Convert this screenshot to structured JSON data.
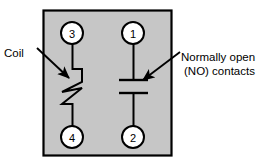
{
  "diagram": {
    "body_panel": {
      "name": "relay-body",
      "fill_color": "#c6c6c6",
      "border_color": "#000000"
    },
    "terminals": [
      {
        "id": "terminal-3",
        "label": "3",
        "cx": 72,
        "cy": 33,
        "r": 11
      },
      {
        "id": "terminal-1",
        "label": "1",
        "cx": 133,
        "cy": 33,
        "r": 11
      },
      {
        "id": "terminal-4",
        "label": "4",
        "cx": 72,
        "cy": 137,
        "r": 11
      },
      {
        "id": "terminal-2",
        "label": "2",
        "cx": 133,
        "cy": 137,
        "r": 11
      }
    ],
    "annotations": [
      {
        "id": "coil-annotation",
        "lines": [
          "Coil"
        ],
        "text_x": 4,
        "text_y": 57,
        "arrow_from": [
          37,
          48
        ],
        "arrow_to": [
          70,
          79
        ]
      },
      {
        "id": "no-contacts-annotation",
        "lines": [
          "Normally open",
          "(NO) contacts"
        ],
        "text_x": 181,
        "text_y": 57,
        "arrow_from": [
          179,
          52
        ],
        "arrow_to": [
          142,
          81
        ]
      }
    ],
    "symbols": {
      "coil": {
        "name": "coil-zigzag-symbol",
        "description": "Zigzag resistor-style coil winding between terminal 3 and terminal 4"
      },
      "contacts": {
        "name": "normally-open-contacts-symbol",
        "description": "Two parallel horizontal plates with a gap between terminal 1 and terminal 2"
      }
    },
    "colors": {
      "panel_fill": "#c6c6c6",
      "line": "#000000",
      "terminal_fill": "#ffffff",
      "page_background": "#ffffff"
    }
  }
}
